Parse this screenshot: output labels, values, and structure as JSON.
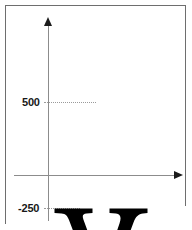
{
  "figure": {
    "kind": "font-metrics-diagram",
    "background_color": "#ffffff",
    "frame_color": "#6e6e6e",
    "axis_color": "#8c8c8c",
    "arrow_color": "#1b1b1b",
    "leader_color": "#9a9a9a",
    "glyph": {
      "character": "y",
      "style": "serif-lowercase",
      "color": "#000000"
    },
    "axes": {
      "vertical_name": "y-axis",
      "horizontal_name": "x-axis (baseline)",
      "origin_label": ""
    },
    "ticks": [
      {
        "label": "500",
        "value": 500,
        "meaning": "x-height / top of glyph"
      },
      {
        "label": "-250",
        "value": -250,
        "meaning": "descender depth / bottom of glyph"
      }
    ]
  }
}
